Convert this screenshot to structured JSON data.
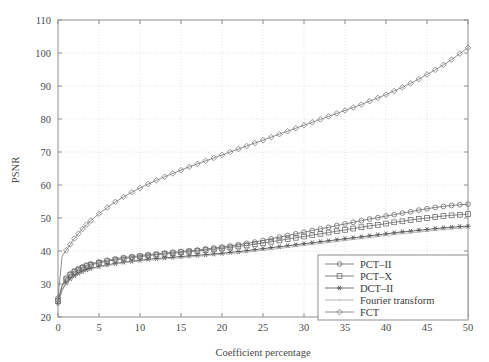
{
  "chart_data": {
    "type": "line",
    "title": "",
    "xlabel": "Coefficient percentage",
    "ylabel": "PSNR",
    "xlim": [
      0,
      50
    ],
    "ylim": [
      20,
      110
    ],
    "xticks": [
      0,
      5,
      10,
      15,
      20,
      25,
      30,
      35,
      40,
      45,
      50
    ],
    "yticks": [
      20,
      30,
      40,
      50,
      60,
      70,
      80,
      90,
      100,
      110
    ],
    "grid": true,
    "legend_position": "bottom-right",
    "x": [
      0,
      0.5,
      1,
      1.5,
      2,
      2.5,
      3,
      3.5,
      4,
      5,
      6,
      7,
      8,
      9,
      10,
      11,
      12,
      13,
      14,
      15,
      16,
      17,
      18,
      19,
      20,
      21,
      22,
      23,
      24,
      25,
      26,
      27,
      28,
      29,
      30,
      31,
      32,
      33,
      34,
      35,
      36,
      37,
      38,
      39,
      40,
      41,
      42,
      43,
      44,
      45,
      46,
      47,
      48,
      49,
      50
    ],
    "series": [
      {
        "name": "PCT-II",
        "marker": "circle",
        "color": "#6e6e6e",
        "values": [
          25.2,
          29.6,
          31.8,
          33.1,
          34.0,
          34.7,
          35.2,
          35.7,
          36.1,
          36.7,
          37.2,
          37.6,
          38.0,
          38.3,
          38.6,
          38.9,
          39.1,
          39.4,
          39.6,
          39.8,
          40.1,
          40.3,
          40.6,
          40.9,
          41.2,
          41.5,
          41.9,
          42.3,
          42.7,
          43.2,
          43.7,
          44.2,
          44.7,
          45.2,
          45.7,
          46.2,
          46.7,
          47.2,
          47.7,
          48.2,
          48.7,
          49.2,
          49.7,
          50.1,
          50.6,
          51.0,
          51.5,
          51.9,
          52.4,
          52.8,
          53.2,
          53.5,
          53.8,
          54.0,
          54.2
        ]
      },
      {
        "name": "PCT-X",
        "marker": "square",
        "color": "#6e6e6e",
        "values": [
          24.8,
          29.2,
          31.4,
          32.7,
          33.6,
          34.3,
          34.9,
          35.4,
          35.8,
          36.4,
          36.9,
          37.3,
          37.7,
          38.0,
          38.3,
          38.6,
          38.9,
          39.1,
          39.3,
          39.6,
          39.8,
          40.0,
          40.3,
          40.5,
          40.8,
          41.1,
          41.4,
          41.7,
          42.1,
          42.4,
          42.8,
          43.2,
          43.6,
          44.0,
          44.4,
          44.8,
          45.2,
          45.6,
          46.0,
          46.4,
          46.8,
          47.2,
          47.6,
          47.9,
          48.3,
          48.7,
          49.0,
          49.4,
          49.7,
          50.0,
          50.3,
          50.6,
          50.8,
          51.0,
          51.2
        ]
      },
      {
        "name": "DCT-II",
        "marker": "asterisk",
        "color": "#555555",
        "values": [
          24.2,
          28.2,
          30.3,
          31.6,
          32.5,
          33.2,
          33.8,
          34.3,
          34.7,
          35.3,
          35.8,
          36.2,
          36.6,
          36.9,
          37.2,
          37.5,
          37.7,
          37.9,
          38.1,
          38.3,
          38.5,
          38.7,
          38.9,
          39.1,
          39.3,
          39.6,
          39.8,
          40.1,
          40.4,
          40.7,
          41.0,
          41.3,
          41.6,
          41.9,
          42.2,
          42.5,
          42.8,
          43.1,
          43.4,
          43.7,
          44.0,
          44.3,
          44.6,
          44.9,
          45.2,
          45.5,
          45.8,
          46.0,
          46.3,
          46.5,
          46.8,
          47.0,
          47.2,
          47.4,
          47.5
        ]
      },
      {
        "name": "Fourier transform",
        "marker": "dot",
        "color": "#a8a8a8",
        "values": [
          24.0,
          28.0,
          30.1,
          31.4,
          32.3,
          33.0,
          33.6,
          34.1,
          34.5,
          35.1,
          35.6,
          36.0,
          36.4,
          36.7,
          37.0,
          37.2,
          37.4,
          37.6,
          37.8,
          38.0,
          38.2,
          38.4,
          38.6,
          38.8,
          39.0,
          39.2,
          39.5,
          39.7,
          40.0,
          40.2,
          40.5,
          40.8,
          41.1,
          41.4,
          41.7,
          42.0,
          42.3,
          42.6,
          42.9,
          43.2,
          43.5,
          43.8,
          44.1,
          44.4,
          44.7,
          45.0,
          45.3,
          45.5,
          45.8,
          46.0,
          46.3,
          46.5,
          46.7,
          46.9,
          47.1
        ]
      },
      {
        "name": "FCT",
        "marker": "diamond",
        "color": "#7a7a7a",
        "values": [
          25.8,
          38.4,
          40.2,
          42.0,
          43.8,
          45.3,
          46.7,
          48.0,
          49.2,
          51.3,
          53.2,
          54.9,
          56.4,
          57.8,
          59.1,
          60.3,
          61.4,
          62.5,
          63.5,
          64.5,
          65.5,
          66.4,
          67.3,
          68.2,
          69.1,
          70.0,
          70.9,
          71.8,
          72.7,
          73.6,
          74.5,
          75.4,
          76.3,
          77.2,
          78.1,
          79.0,
          79.9,
          80.8,
          81.7,
          82.6,
          83.5,
          84.4,
          85.4,
          86.4,
          87.4,
          88.5,
          89.6,
          90.8,
          92.1,
          93.5,
          94.9,
          96.4,
          98.0,
          99.8,
          101.6
        ]
      }
    ],
    "legend_entries": [
      {
        "label": "PCT–II",
        "marker": "circle",
        "color": "#6e6e6e"
      },
      {
        "label": "PCT–X",
        "marker": "square",
        "color": "#6e6e6e"
      },
      {
        "label": "DCT–II",
        "marker": "asterisk",
        "color": "#555555"
      },
      {
        "label": "Fourier transform",
        "marker": "dot",
        "color": "#a8a8a8"
      },
      {
        "label": "FCT",
        "marker": "diamond",
        "color": "#7a7a7a"
      }
    ]
  }
}
